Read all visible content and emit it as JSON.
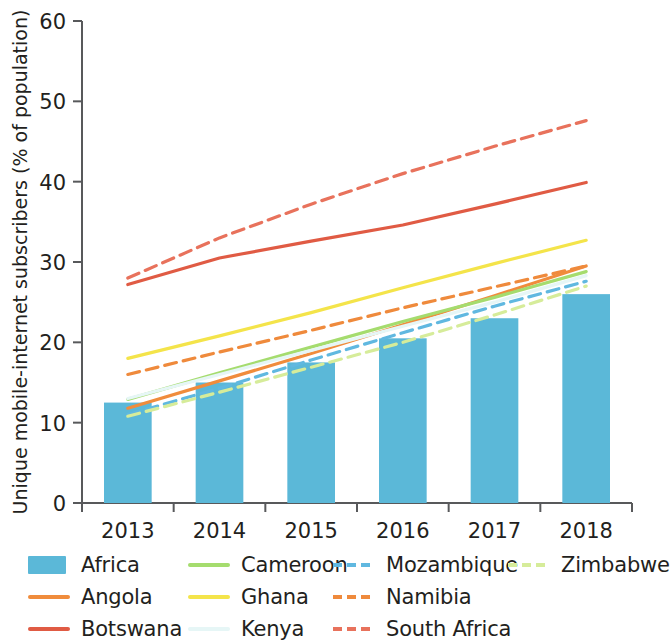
{
  "chart_data": {
    "type": "bar",
    "title": "",
    "subtitle": "",
    "xlabel": "",
    "ylabel": "Unique mobile-internet subscribers (% of population)",
    "categories": [
      "2013",
      "2014",
      "2015",
      "2016",
      "2017",
      "2018"
    ],
    "x": [
      2013,
      2014,
      2015,
      2016,
      2017,
      2018
    ],
    "ylim": [
      0,
      60
    ],
    "yticks": [
      0,
      10,
      20,
      30,
      40,
      50,
      60
    ],
    "ytick_labels": [
      "0",
      "10",
      "20",
      "30",
      "40",
      "50",
      "60"
    ],
    "grid": false,
    "legend_position": "bottom",
    "bar_series": {
      "name": "Africa",
      "color": "#5bb8d8",
      "style": "bar",
      "values": [
        12.5,
        15.0,
        17.5,
        20.5,
        23.0,
        26.0
      ]
    },
    "series": [
      {
        "name": "Africa",
        "style": "bar",
        "color": "#5bb8d8",
        "values": [
          12.5,
          15.0,
          17.5,
          20.5,
          23.0,
          26.0
        ]
      },
      {
        "name": "Angola",
        "style": "solid",
        "color": "#f08c3c",
        "values": [
          11.8,
          15.2,
          18.6,
          22.2,
          25.8,
          29.5
        ]
      },
      {
        "name": "Botswana",
        "style": "solid",
        "color": "#e05b44",
        "values": [
          27.2,
          30.5,
          32.6,
          34.6,
          37.2,
          39.9
        ]
      },
      {
        "name": "Cameroon",
        "style": "solid",
        "color": "#a5dc6e",
        "values": [
          12.9,
          16.2,
          19.4,
          22.6,
          25.6,
          28.8
        ]
      },
      {
        "name": "Ghana",
        "style": "solid",
        "color": "#f4e44a",
        "values": [
          18.0,
          20.8,
          23.7,
          26.8,
          29.8,
          32.7
        ]
      },
      {
        "name": "Kenya",
        "style": "solid",
        "color": "#e6f6f6",
        "values": [
          13.0,
          16.0,
          19.0,
          22.0,
          25.0,
          28.3
        ]
      },
      {
        "name": "Mozambique",
        "style": "dashed",
        "color": "#60b8e0",
        "values": [
          11.0,
          14.3,
          17.8,
          21.2,
          24.5,
          27.6
        ]
      },
      {
        "name": "Namibia",
        "style": "dashed",
        "color": "#ef8a3c",
        "values": [
          16.0,
          18.8,
          21.5,
          24.3,
          26.9,
          29.5
        ]
      },
      {
        "name": "South Africa",
        "style": "dashed",
        "color": "#e8725c",
        "values": [
          28.0,
          33.0,
          37.2,
          41.0,
          44.4,
          47.6
        ]
      },
      {
        "name": "Zimbabwe",
        "style": "dashed",
        "color": "#d6ec9a",
        "values": [
          10.8,
          13.8,
          16.9,
          20.0,
          23.4,
          27.0
        ]
      }
    ]
  },
  "legend": {
    "entries": [
      {
        "label": "Africa",
        "swatch": "bar",
        "color": "#5bb8d8"
      },
      {
        "label": "Cameroon",
        "swatch": "line",
        "color": "#a5dc6e"
      },
      {
        "label": "Mozambique",
        "swatch": "dash",
        "color": "#60b8e0"
      },
      {
        "label": "Zimbabwe",
        "swatch": "dash",
        "color": "#d6ec9a"
      },
      {
        "label": "Angola",
        "swatch": "line",
        "color": "#f08c3c"
      },
      {
        "label": "Ghana",
        "swatch": "line",
        "color": "#f4e44a"
      },
      {
        "label": "Namibia",
        "swatch": "dash",
        "color": "#ef8a3c"
      },
      {
        "label": "",
        "swatch": "none",
        "color": "transparent"
      },
      {
        "label": "Botswana",
        "swatch": "line",
        "color": "#e05b44"
      },
      {
        "label": "Kenya",
        "swatch": "line",
        "color": "#e6f6f6"
      },
      {
        "label": "South Africa",
        "swatch": "dash",
        "color": "#e8725c"
      },
      {
        "label": "",
        "swatch": "none",
        "color": "transparent"
      }
    ]
  },
  "axis": {
    "y_title": "Unique mobile-internet subscribers (% of population)",
    "y_ticks": [
      "60",
      "50",
      "40",
      "30",
      "20",
      "10",
      "0"
    ],
    "x_ticks": [
      "2013",
      "2014",
      "2015",
      "2016",
      "2017",
      "2018"
    ]
  }
}
